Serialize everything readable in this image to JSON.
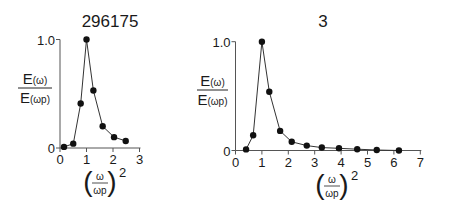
{
  "chart_data": [
    {
      "type": "line",
      "title": "296175",
      "xlabel": "(ω/ωp)^2",
      "ylabel": "E(ω)/E(ωp)",
      "xlim": [
        0,
        3
      ],
      "ylim": [
        0,
        1.0
      ],
      "x_ticks": [
        0,
        1,
        2,
        3
      ],
      "y_ticks": [
        "0",
        "1.0"
      ],
      "grid": false,
      "legend": null,
      "markers": "filled-circle",
      "x": [
        0.15,
        0.5,
        0.78,
        1.0,
        1.26,
        1.61,
        2.04,
        2.48
      ],
      "y": [
        0.01,
        0.04,
        0.41,
        1.0,
        0.53,
        0.2,
        0.1,
        0.065
      ]
    },
    {
      "type": "line",
      "title": "3",
      "xlabel": "(ω/ωp)^2",
      "ylabel": "E(ω)/E(ωp)",
      "xlim": [
        0,
        7
      ],
      "ylim": [
        0,
        1.0
      ],
      "x_ticks": [
        0,
        1,
        2,
        3,
        4,
        5,
        6,
        7
      ],
      "y_ticks": [
        "0",
        "1.0"
      ],
      "grid": false,
      "legend": null,
      "markers": "filled-circle",
      "x": [
        0.4,
        0.67,
        1.0,
        1.28,
        1.69,
        2.13,
        2.7,
        3.27,
        3.92,
        4.61,
        5.35,
        6.19
      ],
      "y": [
        0.01,
        0.14,
        1.0,
        0.54,
        0.18,
        0.08,
        0.045,
        0.027,
        0.02,
        0.012,
        0.005,
        0.0
      ]
    }
  ],
  "labels": {
    "ylabel_num_main": "E",
    "ylabel_num_sub": "(ω)",
    "ylabel_den_main": "E",
    "ylabel_den_sub": "(ωp)",
    "xlabel_num": "ω",
    "xlabel_den": "ωp",
    "xlabel_exp": "2"
  },
  "layout": {
    "panels": [
      {
        "x0": 60,
        "y0": 148,
        "xpx": 26.5,
        "ypx": 108.5,
        "title_x": 110,
        "title_y": 27,
        "ylab_x": 35,
        "ylab_bar_y": 88,
        "ylab_bar_x1": 18,
        "ylab_bar_x2": 52,
        "xlab_x": 100,
        "xlab_y": 171
      },
      {
        "x0": 235.5,
        "y0": 150.5,
        "xpx": 26.4,
        "ypx": 108.8,
        "title_x": 323,
        "title_y": 27,
        "ylab_x": 212,
        "ylab_bar_y": 90,
        "ylab_bar_x1": 197,
        "ylab_bar_x2": 228,
        "xlab_x": 332,
        "xlab_y": 174
      }
    ]
  }
}
